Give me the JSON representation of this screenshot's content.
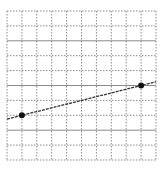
{
  "figure": {
    "type": "coordinate-grid",
    "grid": {
      "columns": 10,
      "rows": 10,
      "left": 7,
      "top": 11,
      "cell": 14.9,
      "line_color": "#8a8a8a",
      "solid_rows": [
        2,
        5,
        8
      ]
    },
    "line": {
      "color": "#333333",
      "from": {
        "col": 0,
        "row": 7.25
      },
      "to": {
        "col": 10,
        "row": 4.75
      }
    },
    "points": [
      {
        "label": "point-a",
        "col": 1,
        "row": 7
      },
      {
        "label": "point-b",
        "col": 9,
        "row": 5
      }
    ],
    "point_color": "#111111"
  }
}
